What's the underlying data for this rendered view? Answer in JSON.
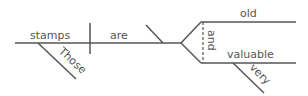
{
  "diagram": {
    "type": "sentence-diagram",
    "subject": "stamps",
    "subject_modifier": "Those",
    "verb": "are",
    "predicate_adjectives": [
      "old",
      "valuable"
    ],
    "conjunction": "and",
    "adjective_modifier": "very",
    "line_color": "#555555"
  }
}
